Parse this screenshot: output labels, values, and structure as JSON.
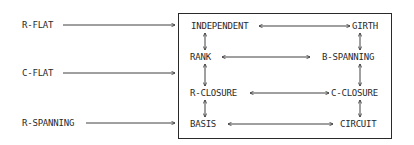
{
  "diagram": {
    "inputs": [
      {
        "label": "R-FLAT",
        "target": "INDEPENDENT"
      },
      {
        "label": "C-FLAT",
        "target": "R-CLOSURE/RANK side"
      },
      {
        "label": "R-SPANNING",
        "target": "BASIS"
      }
    ],
    "box": {
      "left_column": [
        "INDEPENDENT",
        "RANK",
        "R-CLOSURE",
        "BASIS"
      ],
      "right_column": [
        "GIRTH",
        "B-SPANNING",
        "C-CLOSURE",
        "CIRCUIT"
      ]
    },
    "edges": [
      {
        "from": "INDEPENDENT",
        "to": "GIRTH",
        "type": "bidirectional"
      },
      {
        "from": "RANK",
        "to": "B-SPANNING",
        "type": "bidirectional"
      },
      {
        "from": "R-CLOSURE",
        "to": "C-CLOSURE",
        "type": "bidirectional"
      },
      {
        "from": "BASIS",
        "to": "CIRCUIT",
        "type": "bidirectional"
      },
      {
        "from": "INDEPENDENT",
        "to": "RANK",
        "type": "bidirectional"
      },
      {
        "from": "RANK",
        "to": "R-CLOSURE",
        "type": "bidirectional"
      },
      {
        "from": "R-CLOSURE",
        "to": "BASIS",
        "type": "bidirectional"
      },
      {
        "from": "GIRTH",
        "to": "B-SPANNING",
        "type": "bidirectional"
      },
      {
        "from": "B-SPANNING",
        "to": "C-CLOSURE",
        "type": "bidirectional"
      },
      {
        "from": "C-CLOSURE",
        "to": "CIRCUIT",
        "type": "bidirectional"
      }
    ]
  },
  "labels": {
    "r_flat": "R-FLAT",
    "c_flat": "C-FLAT",
    "r_spanning": "R-SPANNING",
    "independent": "INDEPENDENT",
    "rank": "RANK",
    "r_closure": "R-CLOSURE",
    "basis": "BASIS",
    "girth": "GIRTH",
    "b_spanning": "B-SPANNING",
    "c_closure": "C-CLOSURE",
    "circuit": "CIRCUIT"
  },
  "colors": {
    "ink": "#2a2a2a",
    "background": "#ffffff"
  }
}
